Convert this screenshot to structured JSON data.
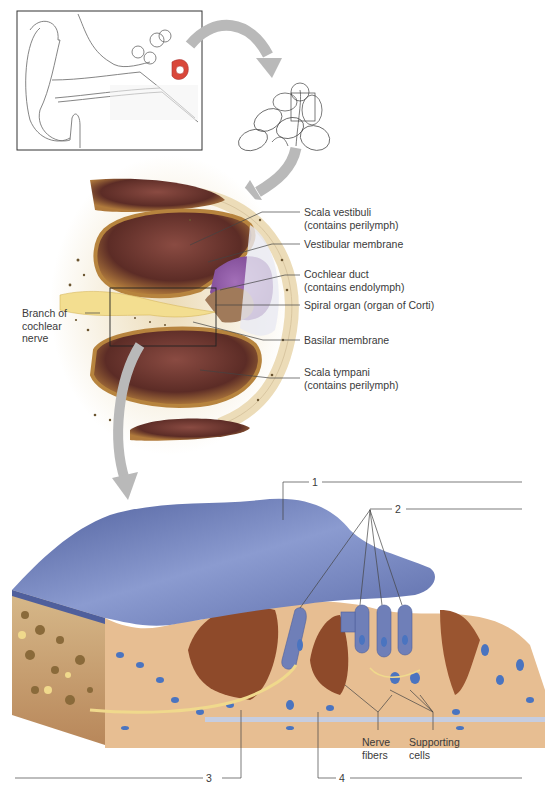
{
  "figure": {
    "panels": [
      {
        "id": "ear-overview",
        "description": "Line drawing of the external, middle and inner ear with cochlea highlighted in red"
      },
      {
        "id": "cochlea-section",
        "description": "Line drawing of sectioned cochlea with boxed turn"
      },
      {
        "id": "cochlear-duct-section",
        "description": "Cross section through one turn of the cochlea"
      },
      {
        "id": "spiral-organ-detail",
        "description": "3D enlargement of the spiral organ"
      }
    ]
  },
  "labels": {
    "scala_vestibuli": {
      "line1": "Scala vestibuli",
      "line2": "(contains perilymph)"
    },
    "vestibular_membrane": "Vestibular membrane",
    "cochlear_duct": {
      "line1": "Cochlear duct",
      "line2": "(contains endolymph)"
    },
    "spiral_organ": "Spiral organ (organ of Corti)",
    "basilar_membrane": "Basilar membrane",
    "scala_tympani": {
      "line1": "Scala tympani",
      "line2": "(contains perilymph)"
    },
    "cochlear_nerve": {
      "line1": "Branch of",
      "line2": "cochlear",
      "line3": "nerve"
    },
    "nerve_fibers": {
      "line1": "Nerve",
      "line2": "fibers"
    },
    "supporting_cells": {
      "line1": "Supporting",
      "line2": "cells"
    }
  },
  "numbered_callouts": [
    "1",
    "2",
    "3",
    "4"
  ],
  "colors": {
    "arrow": "#b9b9b9",
    "bone": "#ecdcb8",
    "scala": "#6e3a32",
    "duct": "#8a4d9a",
    "membrane_blue": "#6f7fb8",
    "tissue": "#e7be92",
    "nucleus": "#4a74c0",
    "nerve": "#f0d98c",
    "highlight_red": "#d9473a"
  }
}
